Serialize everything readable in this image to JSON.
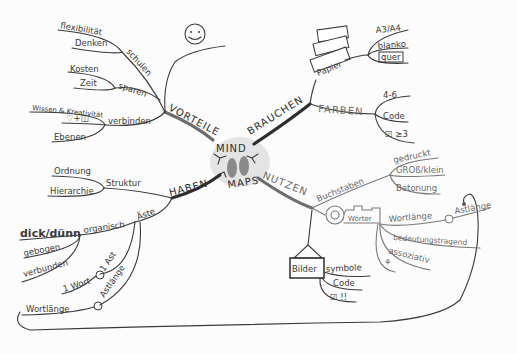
{
  "center": {
    "line1": "MIND",
    "line2": "MAPS"
  },
  "branches": {
    "vorteile": {
      "label": "VORTEILE",
      "sub": [
        {
          "label": "schulen",
          "leaves": [
            "flexibilität",
            "Denken"
          ]
        },
        {
          "label": "sparen",
          "leaves": [
            "Kosten",
            "Zeit"
          ]
        },
        {
          "label": "verbinden",
          "leaves": [
            "Wissen & Kreativität",
            "♡+◫",
            "Ebenen"
          ]
        }
      ],
      "icon": "smiley-icon"
    },
    "brauchen": {
      "label": "BRAUCHEN",
      "sub": [
        {
          "label": "Papier",
          "leaves": [
            "A3/A4",
            "blanko",
            "quer"
          ]
        },
        {
          "label": "FARBEN",
          "leaves": [
            "4-6",
            "Code",
            "☑ ≥3"
          ]
        }
      ]
    },
    "haben": {
      "label": "HABEN",
      "sub": [
        {
          "label": "Struktur",
          "leaves": [
            "Ordnung",
            "Hierarchie"
          ]
        },
        {
          "label": "Äste",
          "leaves": [
            "organisch",
            "dick/dünn",
            "gebogen",
            "verbunden",
            "1 Ast",
            "1 Wort",
            "Astlänge",
            "Wortlänge"
          ]
        }
      ]
    },
    "nutzen": {
      "label": "NUTZEN",
      "sub": [
        {
          "label": "Buchstaben",
          "leaves": [
            "gedruckt",
            "GROß/klein",
            "Betonung"
          ]
        },
        {
          "label": "Wörter",
          "leaves": [
            "Wortlänge",
            "Astlänge",
            "bedeutungstragend",
            "assoziativ",
            "⚘"
          ]
        },
        {
          "label": "Bilder",
          "leaves": [
            "symbole",
            "Code",
            "☑ !!"
          ]
        }
      ]
    }
  }
}
